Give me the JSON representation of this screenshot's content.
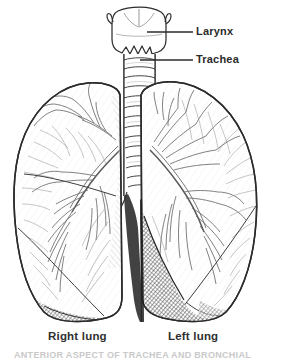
{
  "figure": {
    "width": 281,
    "height": 363,
    "background_color": "#ffffff",
    "ink_color": "#2b2b2b",
    "style": "black-and-white line engraving with cross-hatched shading"
  },
  "callouts": [
    {
      "id": "larynx",
      "label": "Larynx",
      "leader_line": true,
      "points_to": "voice box at top of trachea"
    },
    {
      "id": "trachea",
      "label": "Trachea",
      "leader_line": true,
      "points_to": "ringed windpipe below larynx"
    }
  ],
  "lung_labels": [
    {
      "id": "right-lung",
      "label": "Right lung"
    },
    {
      "id": "left-lung",
      "label": "Left lung"
    }
  ],
  "caption": {
    "text": "ANTERIOR ASPECT OF TRACHEA AND BRONCHIAL",
    "cropped": true,
    "color": "#c9c9c9"
  },
  "anatomy": {
    "larynx": "thyroid cartilage, shield shaped with superior horns",
    "trachea": "segmented cartilage rings descending to carina",
    "right_lung": "three lobes with oblique and horizontal fissures",
    "left_lung": "two lobes with oblique fissure and cardiac notch",
    "bronchial_tree": "branching bronchi and bronchioles drawn inside each lung",
    "shading": "dark cross-hatching at the lung bases and mediastinum"
  },
  "colors": {
    "ink": "#2b2b2b",
    "line": "#4a4a4a",
    "fine_line": "#6f6f6f",
    "shadow": "#3a3a3a",
    "label": "#303030",
    "background": "#ffffff"
  }
}
